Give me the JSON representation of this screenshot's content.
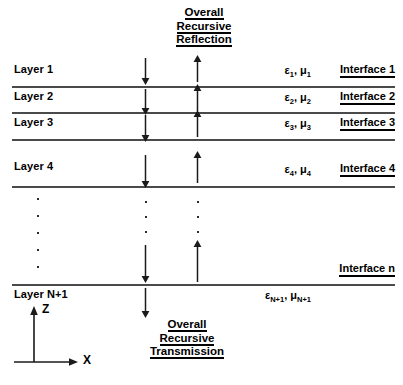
{
  "diagram": {
    "title_top": {
      "lines": [
        "Overall",
        "Recursive",
        "Reflection"
      ]
    },
    "title_bottom": {
      "lines": [
        "Overall",
        "Recursive",
        "Transmission"
      ]
    },
    "layers": [
      {
        "label": "Layer 1",
        "epsilon": "ε",
        "epsilon_sub": "1",
        "mu": "μ",
        "mu_sub": "1",
        "interface": "Interface 1"
      },
      {
        "label": "Layer 2",
        "epsilon": "ε",
        "epsilon_sub": "2",
        "mu": "μ",
        "mu_sub": "2",
        "interface": "Interface 2"
      },
      {
        "label": "Layer 3",
        "epsilon": "ε",
        "epsilon_sub": "3",
        "mu": "μ",
        "mu_sub": "3",
        "interface": "Interface 3"
      },
      {
        "label": "Layer 4",
        "epsilon": "ε",
        "epsilon_sub": "4",
        "mu": "μ",
        "mu_sub": "4",
        "interface": "Interface 4"
      }
    ],
    "ellipsis_interface": "Interface n",
    "bottom_layer": {
      "label": "Layer N+1",
      "epsilon": "ε",
      "epsilon_sub": "N+1",
      "mu": "μ",
      "mu_sub": "N+1"
    },
    "axes": {
      "vertical_label": "Z",
      "horizontal_label": "X"
    },
    "colors": {
      "line": "#4a4a4a",
      "text": "#000000",
      "arrow": "#1a1a1a",
      "background": "#ffffff"
    },
    "ellipsis_dot_counts": {
      "left_column": 5,
      "down_column": 3,
      "up_column": 3
    }
  }
}
